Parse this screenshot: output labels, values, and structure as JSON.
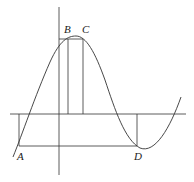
{
  "diagram": {
    "type": "function-graph",
    "points": [
      {
        "name": "A",
        "label": "A",
        "x": 19,
        "y": 146
      },
      {
        "name": "B",
        "label": "B",
        "x": 68,
        "y": 39
      },
      {
        "name": "C",
        "label": "C",
        "x": 83,
        "y": 39
      },
      {
        "name": "D",
        "label": "D",
        "x": 137,
        "y": 146
      }
    ],
    "colors": {
      "line": "#333333",
      "background": "#ffffff"
    }
  }
}
